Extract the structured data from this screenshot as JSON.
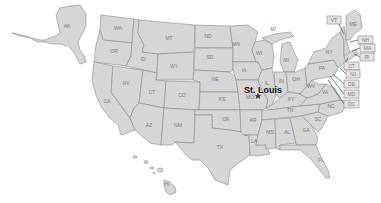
{
  "map": {
    "title": "United States",
    "colors": {
      "state_fill": "#d6d6d6",
      "state_stroke": "#8a8a8a",
      "background": "#ffffff",
      "city_label": "#111111"
    },
    "highlighted_city": {
      "name": "St. Louis",
      "state": "MO",
      "marker": "star-icon"
    },
    "states": {
      "AK": "AK",
      "HI": "HI",
      "WA": "WA",
      "OR": "OR",
      "CA": "CA",
      "NV": "NV",
      "ID": "ID",
      "MT": "MT",
      "WY": "WY",
      "UT": "UT",
      "CO": "CO",
      "AZ": "AZ",
      "NM": "NM",
      "ND": "ND",
      "SD": "SD",
      "NE": "NE",
      "KS": "KS",
      "OK": "OK",
      "TX": "TX",
      "MN": "MN",
      "IA": "IA",
      "MO": "MO",
      "AR": "AR",
      "LA": "LA",
      "WI": "WI",
      "MI": "MI",
      "MI_UP": "MI",
      "IL": "IL",
      "IN": "IN",
      "OH": "OH",
      "KY": "KY",
      "TN": "TN",
      "MS": "MS",
      "AL": "AL",
      "GA": "GA",
      "FL": "FL",
      "SC": "SC",
      "NC": "NC",
      "VA": "VA",
      "WV": "WV",
      "PA": "PA",
      "NY": "NY",
      "ME": "ME"
    },
    "callouts": {
      "VT": "VT",
      "NH": "NH",
      "MA": "MA",
      "RI": "RI",
      "CT": "CT",
      "NJ": "NJ",
      "DE": "DE",
      "MD": "MD",
      "DC": "DC"
    }
  }
}
